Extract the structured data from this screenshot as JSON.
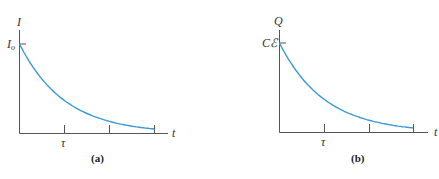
{
  "curve_color": "#3a9ad8",
  "axis_color": "#555555",
  "panels": [
    {
      "caption": "(a)",
      "y_label": "I",
      "y0_label": "I",
      "y0_sub": "o",
      "x_label": "t",
      "tick_label": "τ"
    },
    {
      "caption": "(b)",
      "y_label": "Q",
      "y0_label": "Cℰ",
      "x_label": "t",
      "tick_label": "τ"
    }
  ],
  "chart_data": [
    {
      "type": "line",
      "title": "(a)",
      "xlabel": "t",
      "ylabel": "I",
      "x_ticks": [
        "τ",
        "2τ",
        "3τ"
      ],
      "x_tick_labels_shown": [
        "τ"
      ],
      "y_ticks": [
        "I_o"
      ],
      "series": [
        {
          "name": "I(t) = I_o e^(-t/τ)",
          "x": [
            0,
            0.5,
            1,
            1.5,
            2,
            2.5,
            3
          ],
          "values": [
            1.0,
            0.61,
            0.37,
            0.22,
            0.14,
            0.08,
            0.05
          ]
        }
      ],
      "xlim": [
        0,
        3.3
      ],
      "ylim": [
        0,
        1.3
      ],
      "grid": false,
      "legend": "none"
    },
    {
      "type": "line",
      "title": "(b)",
      "xlabel": "t",
      "ylabel": "Q",
      "x_ticks": [
        "τ",
        "2τ",
        "3τ"
      ],
      "x_tick_labels_shown": [
        "τ"
      ],
      "y_ticks": [
        "Cℰ"
      ],
      "series": [
        {
          "name": "Q(t) = Cℰ e^(-t/τ)",
          "x": [
            0,
            0.5,
            1,
            1.5,
            2,
            2.5,
            3
          ],
          "values": [
            1.0,
            0.61,
            0.37,
            0.22,
            0.14,
            0.08,
            0.05
          ]
        }
      ],
      "xlim": [
        0,
        3.3
      ],
      "ylim": [
        0,
        1.3
      ],
      "grid": false,
      "legend": "none"
    }
  ]
}
